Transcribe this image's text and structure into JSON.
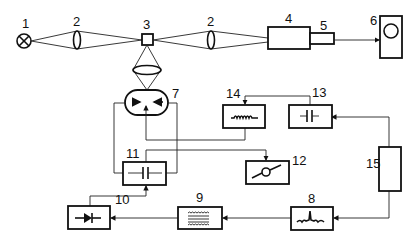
{
  "diagram": {
    "title": "",
    "components": [
      {
        "id": "1",
        "label": "1",
        "kind": "lamp"
      },
      {
        "id": "2a",
        "label": "2",
        "kind": "lens"
      },
      {
        "id": "3",
        "label": "3",
        "kind": "sample-cell"
      },
      {
        "id": "2b",
        "label": "2",
        "kind": "lens"
      },
      {
        "id": "4",
        "label": "4",
        "kind": "spectrometer"
      },
      {
        "id": "5",
        "label": "5",
        "kind": "detector"
      },
      {
        "id": "6",
        "label": "6",
        "kind": "display"
      },
      {
        "id": "7",
        "label": "7",
        "kind": "photomultiplier"
      },
      {
        "id": "8",
        "label": "8",
        "kind": "amplifier"
      },
      {
        "id": "9",
        "label": "9",
        "kind": "filter"
      },
      {
        "id": "10",
        "label": "10",
        "kind": "rectifier-diode"
      },
      {
        "id": "11",
        "label": "11",
        "kind": "capacitor-block"
      },
      {
        "id": "12",
        "label": "12",
        "kind": "voltmeter"
      },
      {
        "id": "13",
        "label": "13",
        "kind": "capacitor"
      },
      {
        "id": "14",
        "label": "14",
        "kind": "inductor"
      },
      {
        "id": "15",
        "label": "15",
        "kind": "power-unit"
      }
    ],
    "labels": {
      "l1": "1",
      "l2a": "2",
      "l3": "3",
      "l2b": "2",
      "l4": "4",
      "l5": "5",
      "l6": "6",
      "l7": "7",
      "l8": "8",
      "l9": "9",
      "l10": "10",
      "l11": "11",
      "l12": "12",
      "l13": "13",
      "l14": "14",
      "l15": "15"
    }
  }
}
